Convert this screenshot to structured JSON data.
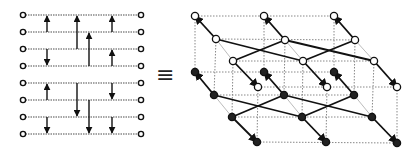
{
  "figure": {
    "equivalence_symbol": "≡",
    "colors": {
      "line": "#111111",
      "dotted": "#888888",
      "node_fill_open": "#ffffff",
      "node_fill_filled": "#222222",
      "faint": "#aaaaaa"
    }
  },
  "network": {
    "wires": 8,
    "wire_y": [
      15,
      32,
      49,
      66,
      83,
      100,
      117,
      134
    ],
    "x_start": 23,
    "x_end": 141,
    "comparators": [
      {
        "x": 47,
        "from": 1,
        "to": 0
      },
      {
        "x": 47,
        "from": 2,
        "to": 3
      },
      {
        "x": 47,
        "from": 5,
        "to": 4
      },
      {
        "x": 47,
        "from": 6,
        "to": 7
      },
      {
        "x": 77,
        "from": 2,
        "to": 0
      },
      {
        "x": 77,
        "from": 4,
        "to": 6
      },
      {
        "x": 89,
        "from": 3,
        "to": 1
      },
      {
        "x": 89,
        "from": 5,
        "to": 7
      },
      {
        "x": 112,
        "from": 1,
        "to": 0
      },
      {
        "x": 112,
        "from": 3,
        "to": 2
      },
      {
        "x": 112,
        "from": 4,
        "to": 5
      },
      {
        "x": 112,
        "from": 6,
        "to": 7
      }
    ]
  },
  "lattice": {
    "top_open": {
      "back": [
        [
          195,
          16
        ],
        [
          264,
          16
        ],
        [
          334,
          16
        ]
      ],
      "mid": [
        [
          216,
          39
        ],
        [
          285,
          40
        ],
        [
          355,
          40
        ]
      ],
      "front": [
        [
          233,
          61
        ],
        [
          303,
          61
        ],
        [
          374,
          61
        ]
      ],
      "extra": [
        [
          258,
          87
        ],
        [
          327,
          87
        ],
        [
          397,
          87
        ]
      ]
    },
    "bottom_filled": {
      "back": [
        [
          195,
          72
        ],
        [
          264,
          72
        ],
        [
          334,
          72
        ]
      ],
      "mid": [
        [
          214,
          95
        ],
        [
          284,
          95
        ],
        [
          354,
          95
        ]
      ],
      "front": [
        [
          232,
          117
        ],
        [
          302,
          117
        ],
        [
          372,
          117
        ]
      ],
      "bottom": [
        [
          257,
          142
        ],
        [
          326,
          142
        ],
        [
          397,
          143
        ]
      ]
    }
  }
}
